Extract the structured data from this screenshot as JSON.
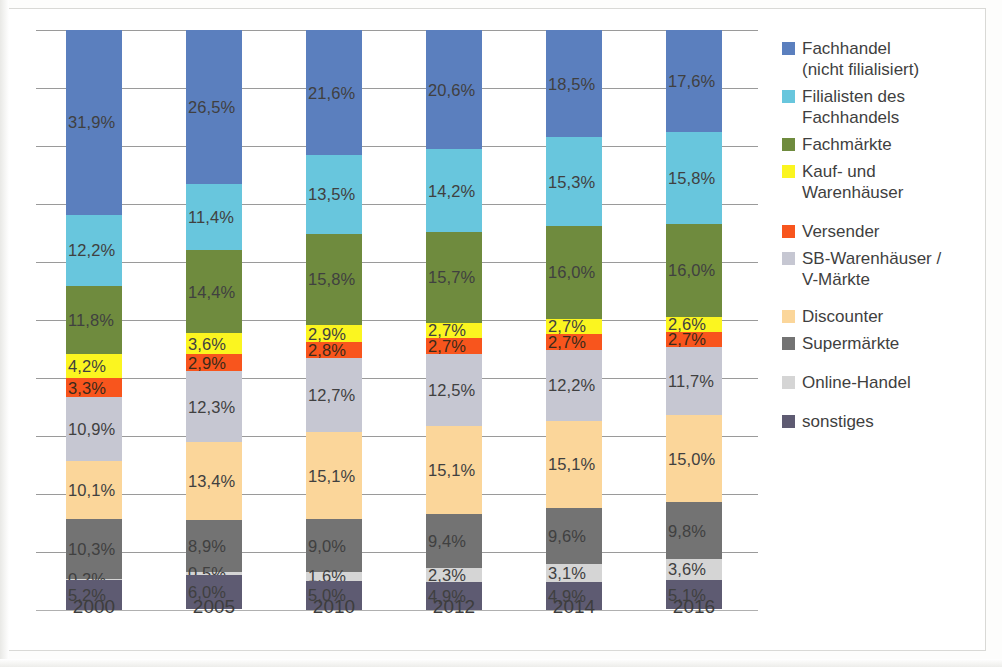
{
  "chart_data": {
    "type": "bar",
    "subtype": "stacked-100-percent",
    "title": "",
    "xlabel": "",
    "ylabel": "",
    "ylim": [
      0,
      100
    ],
    "grid": true,
    "gridline_count": 10,
    "legend_position": "right",
    "categories": [
      "2000",
      "2005",
      "2010",
      "2012",
      "2014",
      "2016"
    ],
    "series": [
      {
        "name": "Fachhandel\n(nicht filialisiert)",
        "color": "#5b7fbe",
        "values": [
          31.9,
          26.5,
          21.6,
          20.6,
          18.5,
          17.6
        ],
        "labels": [
          "31,9%",
          "26,5%",
          "21,6%",
          "20,6%",
          "18,5%",
          "17,6%"
        ]
      },
      {
        "name": "Filialisten des\nFachhandels",
        "color": "#68c6dd",
        "values": [
          12.2,
          11.4,
          13.5,
          14.2,
          15.3,
          15.8
        ],
        "labels": [
          "12,2%",
          "11,4%",
          "13,5%",
          "14,2%",
          "15,3%",
          "15,8%"
        ]
      },
      {
        "name": "Fachmärkte",
        "color": "#6f8b3e",
        "values": [
          11.8,
          14.4,
          15.8,
          15.7,
          16.0,
          16.0
        ],
        "labels": [
          "11,8%",
          "14,4%",
          "15,8%",
          "15,7%",
          "16,0%",
          "16,0%"
        ]
      },
      {
        "name": "Kauf- und\nWarenhäuser",
        "color": "#fbf520",
        "values": [
          4.2,
          3.6,
          2.9,
          2.7,
          2.7,
          2.6
        ],
        "labels": [
          "4,2%",
          "3,6%",
          "2,9%",
          "2,7%",
          "2,7%",
          "2,6%"
        ]
      },
      {
        "name": "Versender",
        "color": "#f8551d",
        "values": [
          3.3,
          2.9,
          2.8,
          2.7,
          2.7,
          2.7
        ],
        "labels": [
          "3,3%",
          "2,9%",
          "2,8%",
          "2,7%",
          "2,7%",
          "2,7%"
        ]
      },
      {
        "name": "SB-Warenhäuser /\nV-Märkte",
        "color": "#c6c7d2",
        "values": [
          10.9,
          12.3,
          12.7,
          12.5,
          12.2,
          11.7
        ],
        "labels": [
          "10,9%",
          "12,3%",
          "12,7%",
          "12,5%",
          "12,2%",
          "11,7%"
        ]
      },
      {
        "name": "Discounter",
        "color": "#fbd69a",
        "values": [
          10.1,
          13.4,
          15.1,
          15.1,
          15.1,
          15.0
        ],
        "labels": [
          "10,1%",
          "13,4%",
          "15,1%",
          "15,1%",
          "15,1%",
          "15,0%"
        ]
      },
      {
        "name": "Supermärkte",
        "color": "#737373",
        "values": [
          10.3,
          8.9,
          9.0,
          9.4,
          9.6,
          9.8
        ],
        "labels": [
          "10,3%",
          "8,9%",
          "9,0%",
          "9,4%",
          "9,6%",
          "9,8%"
        ]
      },
      {
        "name": "Online-Handel",
        "color": "#d5d5d5",
        "values": [
          0.2,
          0.5,
          1.6,
          2.3,
          3.1,
          3.6
        ],
        "labels": [
          "0,2%",
          "0,5%",
          "1,6%",
          "2,3%",
          "3,1%",
          "3,6%"
        ]
      },
      {
        "name": "sonstiges",
        "color": "#5e5b72",
        "values": [
          5.2,
          6.0,
          5.0,
          4.9,
          4.9,
          5.1
        ],
        "labels": [
          "5,2%",
          "6,0%",
          "5,0%",
          "4,9%",
          "4,9%",
          "5,1%"
        ]
      }
    ]
  },
  "legend": {
    "items": [
      {
        "label": "Fachhandel\n(nicht filialisiert)",
        "color": "#5b7fbe"
      },
      {
        "label": "Filialisten des\nFachhandels",
        "color": "#68c6dd"
      },
      {
        "label": "Fachmärkte",
        "color": "#6f8b3e"
      },
      {
        "label": "Kauf- und\nWarenhäuser",
        "color": "#fbf520"
      },
      {
        "label": "Versender",
        "color": "#f8551d"
      },
      {
        "label": "SB-Warenhäuser /\nV-Märkte",
        "color": "#c6c7d2"
      },
      {
        "label": "Discounter",
        "color": "#fbd69a"
      },
      {
        "label": "Supermärkte",
        "color": "#737373"
      },
      {
        "label": "Online-Handel",
        "color": "#d5d5d5"
      },
      {
        "label": "sonstiges",
        "color": "#5e5b72"
      }
    ]
  },
  "axis": {
    "x_tick_labels": [
      "2000",
      "2005",
      "2010",
      "2012",
      "2014",
      "2016"
    ]
  }
}
